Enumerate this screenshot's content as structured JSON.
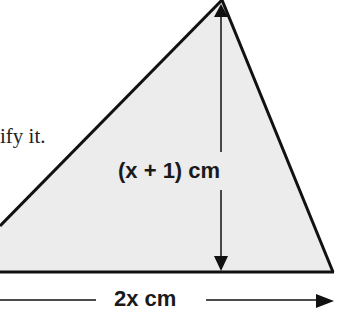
{
  "text": {
    "fragment": "ify it."
  },
  "figure": {
    "type": "triangle",
    "fill_color": "#ececec",
    "stroke_color": "#111111",
    "height_label": "(x + 1) cm",
    "base_label": "2x cm",
    "height_expression": "x + 1",
    "base_expression": "2x",
    "unit": "cm"
  }
}
